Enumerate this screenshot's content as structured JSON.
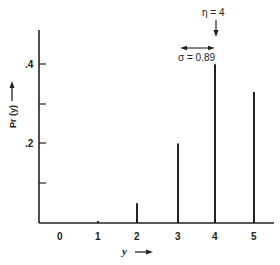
{
  "chart_data": {
    "type": "bar",
    "style": "stem",
    "title": "",
    "xlabel": "y",
    "ylabel": "Pr (y)",
    "categories": [
      "0",
      "1",
      "2",
      "3",
      "4",
      "5"
    ],
    "x": [
      0,
      1,
      2,
      3,
      4,
      5
    ],
    "values": [
      0.0,
      0.005,
      0.05,
      0.2,
      0.4,
      0.33
    ],
    "ylim": [
      0,
      0.48
    ],
    "yticks": [
      0.1,
      0.2,
      0.3,
      0.4
    ],
    "ytick_labels": [
      "",
      ".2",
      "",
      ".4"
    ],
    "xtick_labels": [
      "0",
      "1",
      "2",
      "3",
      "4",
      "5"
    ],
    "grid": false,
    "legend": null,
    "annotations": [
      {
        "text": "η = 4",
        "type": "down-arrow",
        "at_x": 4
      },
      {
        "text": "σ = 0.89",
        "type": "double-arrow",
        "span": [
          3.1,
          4.0
        ]
      }
    ]
  },
  "labels": {
    "ylabel": "Pr (y)",
    "xlabel": "y",
    "eta": "η = 4",
    "sigma": "σ = 0.89",
    "yticks": [
      ".2",
      ".4"
    ],
    "xticks": [
      "0",
      "1",
      "2",
      "3",
      "4",
      "5"
    ]
  },
  "colors": {
    "ink": "#222222",
    "background": "#ffffff"
  }
}
